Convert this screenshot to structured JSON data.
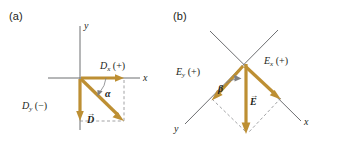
{
  "figure": {
    "background_color": "#ffffff",
    "vector_color": "#bd8f33",
    "axis_color": "#6d6e71",
    "dashed_color": "#8a8c8e",
    "text_color": "#231f20"
  },
  "panels": [
    {
      "id": "a",
      "label": "(a)",
      "axes": {
        "x_label": "x",
        "y_label": "y",
        "orientation": "standard"
      },
      "components": [
        {
          "name": "x-component",
          "symbol": "D",
          "subscript": "x",
          "sign": "(+)",
          "label_text": "D",
          "direction": "right"
        },
        {
          "name": "y-component",
          "symbol": "D",
          "subscript": "y",
          "sign": "(−)",
          "label_text": "D",
          "direction": "down"
        }
      ],
      "resultant": {
        "name": "resultant-vector",
        "symbol": "D",
        "arrow_overbar": "→",
        "quadrant": "fourth"
      },
      "angle": {
        "name": "angle-alpha",
        "symbol": "α",
        "measured_from": "x-axis"
      }
    },
    {
      "id": "b",
      "label": "(b)",
      "axes": {
        "x_label": "x",
        "y_label": "y",
        "orientation": "rotated"
      },
      "components": [
        {
          "name": "x-component",
          "symbol": "E",
          "subscript": "x",
          "sign": "(+)",
          "label_text": "E",
          "direction": "down-right"
        },
        {
          "name": "y-component",
          "symbol": "E",
          "subscript": "y",
          "sign": "(+)",
          "label_text": "E",
          "direction": "down-left"
        }
      ],
      "resultant": {
        "name": "resultant-vector",
        "symbol": "E",
        "arrow_overbar": "→",
        "quadrant": "between-axes"
      },
      "angle": {
        "name": "angle-beta",
        "symbol": "β",
        "measured_from": "y-axis"
      }
    }
  ]
}
